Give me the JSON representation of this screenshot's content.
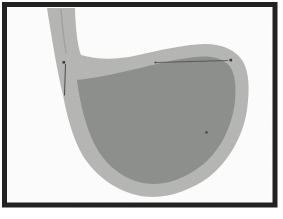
{
  "diagram": {
    "frame": {
      "border_color": "#222222",
      "background": "#fdfdfd"
    },
    "colors": {
      "wall": "#b5b5b4",
      "interior": "#8c8e8b",
      "lumen_line": "#9b9b9b",
      "annotation": "#4a4a4a",
      "annotation_mark": "#3e3e3e"
    },
    "annotations": [
      {
        "id": "cardia-vertical-pointer",
        "text": ""
      },
      {
        "id": "fundus-horizontal-pointer",
        "text": ""
      },
      {
        "id": "body-boundary-dot",
        "text": ""
      }
    ]
  }
}
